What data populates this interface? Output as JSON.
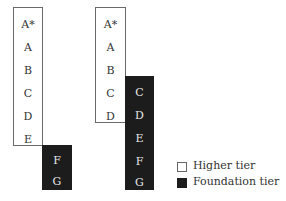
{
  "diagram": {
    "columns": [
      {
        "higher": {
          "grades": [
            "A*",
            "A",
            "B",
            "C",
            "D",
            "E"
          ]
        },
        "foundation": {
          "grades": [
            "F",
            "G"
          ]
        }
      },
      {
        "higher": {
          "grades": [
            "A*",
            "A",
            "B",
            "C",
            "D"
          ]
        },
        "foundation": {
          "grades": [
            "C",
            "D",
            "E",
            "F",
            "G"
          ]
        }
      }
    ],
    "colors": {
      "higher_fill": "#ffffff",
      "foundation_fill": "#1c1c1c",
      "border": "#6a6a6a"
    }
  },
  "legend": {
    "items": [
      {
        "label": "Higher tier",
        "swatch": "white"
      },
      {
        "label": "Foundation tier",
        "swatch": "black"
      }
    ]
  }
}
